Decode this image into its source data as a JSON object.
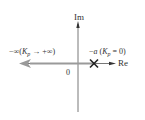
{
  "diagram": {
    "type": "root-locus",
    "axes": {
      "imag_label": "Im",
      "real_label": "Re",
      "origin_label": "0"
    },
    "pole": {
      "marker": "x-icon",
      "label_prefix": "−",
      "label_var": "a",
      "label_open": " (",
      "label_k": "K",
      "label_sub": "p",
      "label_rest": " = 0)"
    },
    "locus_end": {
      "label_prefix": "−∞(",
      "label_k": "K",
      "label_sub": "p",
      "label_rest": " → +∞)"
    },
    "colors": {
      "axis": "#555555",
      "locus_arrow": "#999999",
      "marker": "#222222",
      "text": "#333333"
    }
  }
}
